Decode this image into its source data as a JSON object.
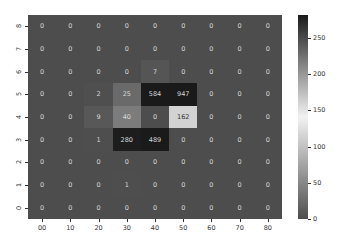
{
  "chart_data": {
    "type": "heatmap",
    "title": "",
    "xlabel": "",
    "ylabel": "",
    "x_tick_labels": [
      "00",
      "10",
      "20",
      "30",
      "40",
      "50",
      "60",
      "70",
      "80"
    ],
    "y_tick_labels_top_to_bottom": [
      "8",
      "7",
      "6",
      "5",
      "4",
      "3",
      "2",
      "1",
      "0"
    ],
    "values_top_to_bottom": [
      [
        0,
        0,
        0,
        0,
        0,
        0,
        0,
        0,
        0
      ],
      [
        0,
        0,
        0,
        0,
        0,
        0,
        0,
        0,
        0
      ],
      [
        0,
        0,
        0,
        0,
        7,
        0,
        0,
        0,
        0
      ],
      [
        0,
        0,
        2,
        25,
        584,
        947,
        0,
        0,
        0
      ],
      [
        0,
        0,
        9,
        40,
        0,
        162,
        0,
        0,
        0
      ],
      [
        0,
        0,
        1,
        280,
        489,
        0,
        0,
        0,
        0
      ],
      [
        0,
        0,
        0,
        0,
        0,
        0,
        0,
        0,
        0
      ],
      [
        0,
        0,
        0,
        1,
        0,
        0,
        0,
        0,
        0
      ],
      [
        0,
        0,
        0,
        0,
        0,
        0,
        0,
        0,
        0
      ]
    ],
    "annotations": true,
    "colorbar": {
      "ticks": [
        0,
        50,
        100,
        150,
        200,
        250
      ],
      "vmin": 0,
      "vmax": 282,
      "colormap": "diverging gray: dark gray (0) -> near-white (~141) -> near-black (282)",
      "position": "right"
    },
    "colors": {
      "low": "#4d4d4d",
      "mid": "#f2f2f2",
      "high": "#1a1a1a"
    }
  }
}
